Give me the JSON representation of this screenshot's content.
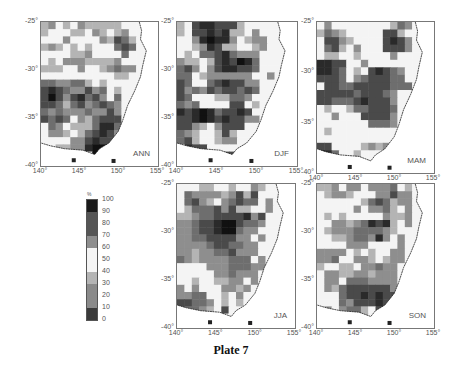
{
  "caption": "Plate 7",
  "legend": {
    "unit": "%",
    "labels": [
      "0",
      "10",
      "20",
      "30",
      "40",
      "50",
      "60",
      "70",
      "80",
      "90",
      "100"
    ],
    "bands": [
      {
        "from": 0,
        "to": 10,
        "color": "#3a3a3a"
      },
      {
        "from": 10,
        "to": 20,
        "color": "#8a8a8a"
      },
      {
        "from": 20,
        "to": 30,
        "color": "#8a8a8a"
      },
      {
        "from": 30,
        "to": 40,
        "color": "#b4b4b4"
      },
      {
        "from": 40,
        "to": 50,
        "color": "#f4f4f4"
      },
      {
        "from": 50,
        "to": 60,
        "color": "#f4f4f4"
      },
      {
        "from": 60,
        "to": 70,
        "color": "#8e8e8e"
      },
      {
        "from": 70,
        "to": 80,
        "color": "#555555"
      },
      {
        "from": 80,
        "to": 90,
        "color": "#555555"
      },
      {
        "from": 90,
        "to": 100,
        "color": "#1a1a1a"
      }
    ]
  },
  "axes": {
    "x_ticks": [
      "140°",
      "145°",
      "150°",
      "155°"
    ],
    "y_ticks": [
      "-25°",
      "-30°",
      "-35°",
      "-40°"
    ]
  },
  "panels": [
    {
      "id": "ann",
      "label": "ANN",
      "x": 40,
      "y": 21,
      "w": 117,
      "h": 144
    },
    {
      "id": "djf",
      "label": "DJF",
      "x": 176,
      "y": 21,
      "w": 120,
      "h": 144
    },
    {
      "id": "mam",
      "label": "MAM",
      "x": 316,
      "y": 21,
      "w": 117,
      "h": 151
    },
    {
      "id": "jja",
      "label": "JJA",
      "x": 176,
      "y": 183,
      "w": 118,
      "h": 144
    },
    {
      "id": "son",
      "label": "SON",
      "x": 316,
      "y": 183,
      "w": 117,
      "h": 144
    }
  ],
  "chart_data": {
    "type": "heatmap",
    "title": "Plate 7",
    "xlabel": "Longitude",
    "ylabel": "Latitude",
    "xlim": [
      140,
      155
    ],
    "ylim": [
      -40,
      -25
    ],
    "colorbar": {
      "label": "%",
      "range": [
        0,
        100
      ],
      "ticks": [
        0,
        10,
        20,
        30,
        40,
        50,
        60,
        70,
        80,
        90,
        100
      ]
    },
    "palette": [
      "#f4f4f4",
      "#b4b4b4",
      "#8e8e8e",
      "#6e6e6e",
      "#4a4a4a",
      "#2a2a2a",
      "#111111"
    ],
    "grid_note": "Values are band indices 0=light(40-60%) ... 6=black(90-100%); '.' = ocean / no data",
    "panels": [
      {
        "name": "ANN",
        "rows": [
          "1201021111100...",
          "1000110210120...",
          "0002000021431...",
          "1210101000343...",
          "0000112000030...",
          "0102221111200...",
          "1110020012322...",
          "0000000000110...",
          "3322331010000...",
          "4543224230100...",
          "4642453420300....",
          "4431342343201...",
          "3232223224200....",
          "4343021344400....",
          "0320111355300....",
          "0221013454200.....",
          "0000224544410.....",
          "0011225666200.....",
          "..134..665.........",
          "................"
        ]
      },
      {
        "name": "DJF",
        "rows": [
          "1045544410000...",
          "1044545110200...",
          "0025655201220...",
          "0012541100120...",
          "0103345322200...",
          "2110145465300...",
          "3420245544300...",
          "3301222222002...",
          "4300345442200...",
          "4232434434300...",
          "4300011332000....",
          "3230000440100....",
          "5456534454000....",
          "4456545442200....",
          "4421024440000....",
          "3210014100000.....",
          "3410012200000.....",
          "0544000000000.....",
          "..41.544..........",
          "................"
        ]
      },
      {
        "name": "MAM",
        "rows": [
          "0200000000132...",
          "1321000004410...",
          "0442100004542...",
          "0341020004442...",
          "0110010000200...",
          "5544002000000...",
          "5543010454320...",
          "4443023444330...",
          "0443344444333...",
          "4444434443200...",
          "4433345444200....",
          "0100133444300....",
          "0020004444200....",
          "0000000333200....",
          "0100000000000....",
          "0000000000000.....",
          "4400001212000.....",
          "6530010000000.....",
          "..54000.0.........",
          "................"
        ]
      },
      {
        "name": "JJA",
        "rows": [
          "0001100100210...",
          "0322221241400...",
          "0342102343302...",
          "0133342411002...",
          "1123344445240...",
          "2234456643320...",
          "2234456632200...",
          "2233444422020...",
          "2222344332200...",
          "2212233422200...",
          "3212222333020....",
          "0000222333220....",
          "0000022322200....",
          "0010011220200....",
          "2020002212000....",
          "2233001020000.....",
          "4433201010000.....",
          "4332104000000.....",
          "..52..............",
          "................"
        ]
      },
      {
        "name": "SON",
        "rows": [
          "1120220222301...",
          "0122100022422...",
          "0000001343122...",
          "0000020223102...",
          "0101000002112...",
          "0022123545102...",
          "0122233332100...",
          "0011233252020...",
          "0000222000020...",
          "2222010100220...",
          "2230022101220....",
          "1001102232200....",
          "0221122122200....",
          "0220333222200....",
          "0213444444200....",
          "0003445454430.....",
          "0003244454630.....",
          "0202331040000.....",
          "..122.10..........",
          "................"
        ]
      }
    ]
  }
}
